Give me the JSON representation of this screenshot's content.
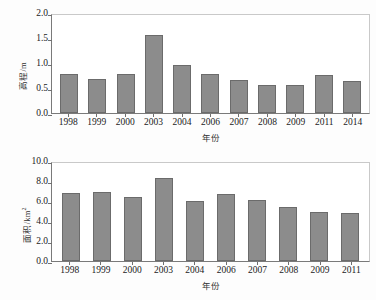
{
  "chart_data": [
    {
      "id": "elevation",
      "type": "bar",
      "title": "",
      "xlabel": "年份",
      "ylabel": "高程/m",
      "ylabel_unit_sup": "",
      "categories": [
        "1998",
        "1999",
        "2000",
        "2003",
        "2004",
        "2006",
        "2007",
        "2008",
        "2009",
        "2011",
        "2014"
      ],
      "values": [
        0.8,
        0.69,
        0.8,
        1.6,
        0.99,
        0.79,
        0.68,
        0.58,
        0.57,
        0.77,
        0.66
      ],
      "ylim": [
        0.0,
        2.0
      ],
      "yticks": [
        "0.0",
        "0.5",
        "1.0",
        "1.5",
        "2.0"
      ],
      "ytick_values": [
        0.0,
        0.5,
        1.0,
        1.5,
        2.0
      ],
      "grid": false,
      "legend": "none",
      "bar_color": "#8c8c8c",
      "bar_edge_color": "#6b6b6b"
    },
    {
      "id": "area",
      "type": "bar",
      "title": "",
      "xlabel": "年份",
      "ylabel": "面积/km",
      "ylabel_unit_sup": "2",
      "categories": [
        "1998",
        "1999",
        "2000",
        "2003",
        "2004",
        "2006",
        "2007",
        "2008",
        "2009",
        "2011"
      ],
      "values": [
        6.95,
        7.0,
        6.55,
        8.5,
        6.1,
        6.85,
        6.2,
        5.55,
        5.05,
        4.95
      ],
      "ylim": [
        0.0,
        10.0
      ],
      "yticks": [
        "0.0",
        "2.0",
        "4.0",
        "6.0",
        "8.0",
        "10.0"
      ],
      "ytick_values": [
        0.0,
        2.0,
        4.0,
        6.0,
        8.0,
        10.0
      ],
      "grid": false,
      "legend": "none",
      "bar_color": "#8c8c8c",
      "bar_edge_color": "#6b6b6b"
    }
  ]
}
